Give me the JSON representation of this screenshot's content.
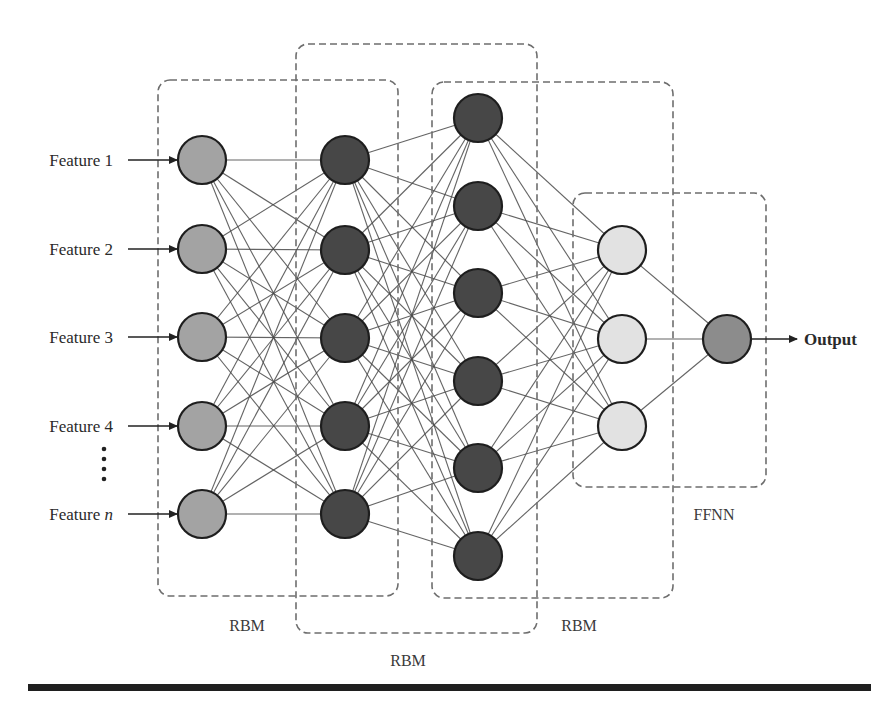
{
  "diagram": {
    "title": "",
    "type": "neural-network-architecture",
    "colors": {
      "input_node": "#a3a3a3",
      "hidden_node": "#474747",
      "ffnn_hidden_node": "#e2e2e2",
      "output_node": "#8c8c8c",
      "box_stroke": "#6e6e6e",
      "edge": "#4a4a4a"
    },
    "inputs": [
      {
        "label": "Feature 1",
        "y": 160
      },
      {
        "label": "Feature 2",
        "y": 249
      },
      {
        "label": "Feature 3",
        "y": 337
      },
      {
        "label": "Feature 4",
        "y": 426
      },
      {
        "label": "Feature n",
        "y": 514,
        "italic_part": "n"
      }
    ],
    "ellipsis": "⋮",
    "layers": [
      {
        "name": "input",
        "x": 202,
        "ys": [
          160,
          249,
          337,
          426,
          514
        ],
        "fill": "input_node"
      },
      {
        "name": "hidden-1",
        "x": 345,
        "ys": [
          160,
          250,
          338,
          426,
          514
        ],
        "fill": "hidden_node"
      },
      {
        "name": "hidden-2",
        "x": 478,
        "ys": [
          118,
          206,
          293,
          381,
          468,
          556
        ],
        "fill": "hidden_node"
      },
      {
        "name": "hidden-3",
        "x": 622,
        "ys": [
          250,
          339,
          426
        ],
        "fill": "ffnn_hidden_node"
      },
      {
        "name": "output",
        "x": 727,
        "ys": [
          339
        ],
        "fill": "output_node"
      }
    ],
    "node_radius": 24,
    "groups": [
      {
        "label": "RBM",
        "box": {
          "x": 158,
          "y": 80,
          "w": 240,
          "h": 516
        },
        "label_pos": {
          "x": 247,
          "y": 631
        }
      },
      {
        "label": "RBM",
        "box": {
          "x": 296,
          "y": 44,
          "w": 241,
          "h": 589
        },
        "label_pos": {
          "x": 408,
          "y": 666
        }
      },
      {
        "label": "RBM",
        "box": {
          "x": 432,
          "y": 82,
          "w": 241,
          "h": 516
        },
        "label_pos": {
          "x": 579,
          "y": 631
        }
      },
      {
        "label": "FFNN",
        "box": {
          "x": 573,
          "y": 193,
          "w": 193,
          "h": 294
        },
        "label_pos": {
          "x": 714,
          "y": 520
        }
      }
    ],
    "output": {
      "label": "Output",
      "arrow_from": 751,
      "arrow_to": 797,
      "y": 339,
      "text_x": 804
    }
  }
}
